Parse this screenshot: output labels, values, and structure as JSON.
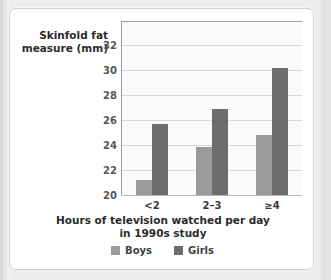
{
  "card": {
    "background": "#ffffff",
    "border_color": "#cfcfcf"
  },
  "chart_data": {
    "type": "bar",
    "title": "",
    "subtitle": "",
    "xlabel": "Hours of television watched per day in 1990s study",
    "xlabel_line1": "Hours of television watched per day",
    "xlabel_line2": "in 1990s study",
    "ylabel": "Skinfold fat measure (mm)",
    "ylabel_line1": "Skinfold fat",
    "ylabel_line2": "measure (mm)",
    "categories": [
      "<2",
      "2–3",
      "≥4"
    ],
    "series": [
      {
        "name": "Boys",
        "color": "#9b9b9b",
        "values": [
          21.2,
          23.8,
          24.8
        ]
      },
      {
        "name": "Girls",
        "color": "#6d6d6d",
        "values": [
          25.7,
          26.9,
          30.1
        ]
      }
    ],
    "ylim": [
      20,
      33.8
    ],
    "yticks": [
      20,
      22,
      24,
      26,
      28,
      30,
      32
    ],
    "ytick_labels": [
      "20",
      "22",
      "24",
      "26",
      "28",
      "30",
      "32"
    ],
    "grid": true,
    "grid_axis": "y",
    "grid_color": "#d8d8d8",
    "axis_color": "#9d9d9d",
    "legend": [
      "Boys",
      "Girls"
    ],
    "legend_position": "bottom-center",
    "plot_background": "#fbfbfb"
  }
}
